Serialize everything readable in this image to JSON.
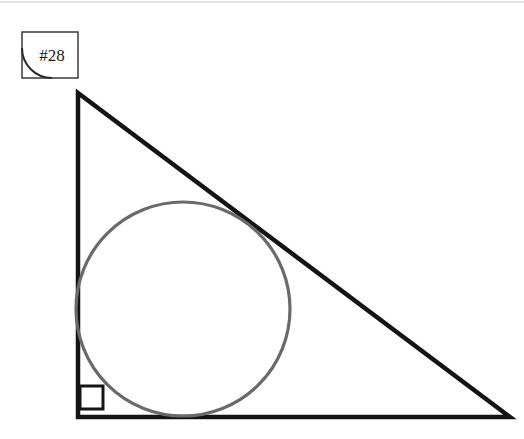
{
  "canvas": {
    "width": 524,
    "height": 439,
    "background_color": "#ffffff"
  },
  "top_rule": {
    "color": "#c8c8c8",
    "y": 2,
    "thickness": 1
  },
  "label_box": {
    "text": "#28",
    "border_color": "#3a3a3a",
    "border_width": 1.5,
    "x": 22,
    "y": 32,
    "width": 56,
    "height": 46,
    "corner_arc": {
      "present": true,
      "corner": "bottom-left",
      "color": "#2b2b2b",
      "stroke_width": 2,
      "radius": 30
    }
  },
  "figure": {
    "triangle": {
      "stroke_color": "#141414",
      "stroke_width": 4.5,
      "vertices": [
        {
          "name": "apex",
          "x": 78,
          "y": 93
        },
        {
          "name": "right-angle-vertex",
          "x": 78,
          "y": 417
        },
        {
          "name": "base-right-vertex",
          "x": 510,
          "y": 417
        }
      ],
      "legs": {
        "vertical_length": 324,
        "horizontal_length": 432
      }
    },
    "right_angle_marker": {
      "stroke_color": "#141414",
      "stroke_width": 3,
      "x": 80,
      "y": 386,
      "size": 23
    },
    "incircle": {
      "stroke_color": "#6a6a6a",
      "stroke_width": 3.2,
      "fill": "none",
      "center_x": 183,
      "center_y": 309,
      "radius": 107
    }
  }
}
